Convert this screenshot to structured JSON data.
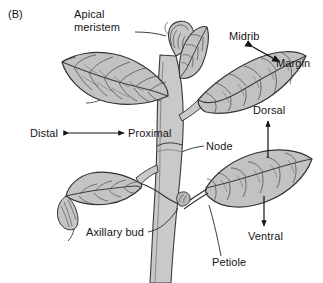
{
  "figure": {
    "panel_label": "(B)",
    "colors": {
      "leaf_fill": "#bdbdbd",
      "leaf_fill_light": "#cfcfcf",
      "stem_fill": "#c9c9c9",
      "outline": "#3b3b3b",
      "vein": "#4a4a4a",
      "text": "#161616",
      "arrow": "#111111",
      "background": "#ffffff"
    }
  },
  "labels": [
    {
      "id": "apical-meristem",
      "text": "Apical\nmeristem",
      "x": 74,
      "y": 8,
      "connector": "leader-line"
    },
    {
      "id": "midrib",
      "text": "Midrib",
      "x": 229,
      "y": 30,
      "connector": "double-arrow-diagonal"
    },
    {
      "id": "margin",
      "text": "Margin",
      "x": 276,
      "y": 57,
      "connector": "double-arrow-diagonal"
    },
    {
      "id": "dorsal",
      "text": "Dorsal",
      "x": 253,
      "y": 108,
      "connector": "arrow-up"
    },
    {
      "id": "distal",
      "text": "Distal",
      "x": 30,
      "y": 127,
      "connector": "double-arrow-horizontal"
    },
    {
      "id": "proximal",
      "text": "Proximal",
      "x": 128,
      "y": 127,
      "connector": "double-arrow-horizontal"
    },
    {
      "id": "node",
      "text": "Node",
      "x": 206,
      "y": 140,
      "connector": "leader-line"
    },
    {
      "id": "axillary-bud",
      "text": "Axillary bud",
      "x": 86,
      "y": 228,
      "connector": "leader-line"
    },
    {
      "id": "ventral",
      "text": "Ventral",
      "x": 248,
      "y": 232,
      "connector": "arrow-down"
    },
    {
      "id": "petiole",
      "text": "Petiole",
      "x": 212,
      "y": 258,
      "connector": "leader-line"
    }
  ],
  "structures": [
    {
      "id": "main-stem",
      "name": "main stem"
    },
    {
      "id": "apical-bud",
      "name": "apical meristem bud"
    },
    {
      "id": "leaf-upper-left",
      "name": "upper left leaf"
    },
    {
      "id": "leaf-upper-small",
      "name": "small apex leaf"
    },
    {
      "id": "leaf-upper-right",
      "name": "upper right leaf"
    },
    {
      "id": "leaf-lower-left",
      "name": "lower left leaf"
    },
    {
      "id": "leaf-lower-right",
      "name": "lower right leaf"
    },
    {
      "id": "axillary-bud",
      "name": "axillary bud"
    },
    {
      "id": "petiole",
      "name": "petiole"
    },
    {
      "id": "node",
      "name": "node"
    }
  ]
}
